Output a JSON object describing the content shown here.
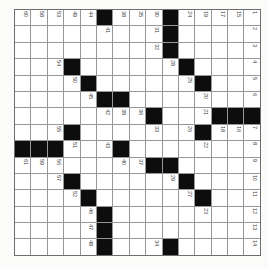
{
  "puzzle": {
    "kind": "crossword-grid-rotated-90cw",
    "rows_count": 15,
    "cols_count": 15,
    "colors": {
      "background": "#fbfbf9",
      "cell_white": "#ffffff",
      "cell_black": "#0d0d0d",
      "grid_line": "#979797",
      "outer_border": "#6e6e6e",
      "number_text": "#3c3c3c"
    },
    "rows": [
      [
        "60",
        "58",
        "53",
        "49",
        "44",
        "#",
        "38",
        "35",
        "30",
        "#",
        "24",
        "19",
        "17",
        "15",
        "1"
      ],
      [
        "",
        "",
        "",
        "",
        "",
        "41",
        "",
        "",
        "31",
        "#",
        "",
        "",
        "",
        "",
        "2"
      ],
      [
        "",
        "",
        "",
        "",
        "",
        "",
        "",
        "",
        "32",
        "#",
        "",
        "",
        "",
        "",
        "3"
      ],
      [
        "",
        "",
        "54",
        "#",
        "",
        "",
        "",
        "",
        "",
        "28",
        "#",
        "",
        "",
        "",
        "4"
      ],
      [
        "",
        "",
        "",
        "50",
        "#",
        "",
        "",
        "",
        "",
        "",
        "25",
        "#",
        "",
        "",
        "5"
      ],
      [
        "",
        "",
        "",
        "",
        "45",
        "#",
        "#",
        "",
        "",
        "",
        "",
        "20",
        "",
        "",
        "6"
      ],
      [
        "",
        "",
        "",
        "",
        "",
        "42",
        "39",
        "36",
        "#",
        "",
        "",
        "21",
        "#",
        "#",
        "#"
      ],
      [
        "",
        "",
        "55",
        "#",
        "",
        "",
        "",
        "",
        "33",
        "",
        "26",
        "#",
        "18",
        "16",
        "7"
      ],
      [
        "#",
        "#",
        "#",
        "51",
        "",
        "43",
        "#",
        "",
        "",
        "",
        "",
        "22",
        "",
        "",
        "8"
      ],
      [
        "61",
        "59",
        "56",
        "",
        "",
        "",
        "40",
        "37",
        "#",
        "#",
        "",
        "",
        "",
        "",
        "9"
      ],
      [
        "",
        "",
        "57",
        "#",
        "",
        "",
        "",
        "",
        "",
        "29",
        "#",
        "",
        "",
        "",
        "10"
      ],
      [
        "",
        "",
        "",
        "52",
        "#",
        "",
        "",
        "",
        "",
        "",
        "27",
        "#",
        "",
        "",
        "11"
      ],
      [
        "",
        "",
        "",
        "",
        "46",
        "#",
        "",
        "",
        "",
        "",
        "",
        "23",
        "",
        "",
        "12"
      ],
      [
        "",
        "",
        "",
        "",
        "47",
        "#",
        "",
        "",
        "",
        "",
        "",
        "",
        "",
        "",
        "13"
      ],
      [
        "",
        "",
        "",
        "",
        "48",
        "#",
        "",
        "",
        "34",
        "#",
        "",
        "",
        "",
        "",
        "14"
      ]
    ]
  }
}
